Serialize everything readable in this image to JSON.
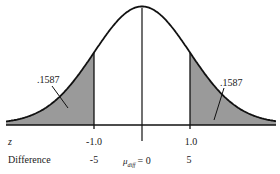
{
  "figure": {
    "colors": {
      "background": "#ffffff",
      "curve": "#111111",
      "shade": "#9a9a9a",
      "text": "#1a1a1a"
    },
    "left_tail": {
      "label": ".1587"
    },
    "right_tail": {
      "label": ".1587"
    },
    "axis": {
      "z_label": "z",
      "difference_label": "Difference",
      "z_ticks": [
        "-1.0",
        "1.0"
      ],
      "difference_ticks": [
        "-5",
        "5"
      ],
      "center_label_mu": "μ",
      "center_label_sub": "diff",
      "center_label_eq": "= 0"
    }
  },
  "chart_data": {
    "type": "area",
    "title": "",
    "xlabel": "z / Difference",
    "ylabel": "",
    "distribution": "normal",
    "mean": 0,
    "sd_difference": 5,
    "shaded_regions": [
      {
        "z_range": [
          "-inf",
          -1.0
        ],
        "difference_range": [
          "-inf",
          -5
        ],
        "area": 0.1587,
        "label": ".1587"
      },
      {
        "z_range": [
          1.0,
          "inf"
        ],
        "difference_range": [
          5,
          "inf"
        ],
        "area": 0.1587,
        "label": ".1587"
      }
    ],
    "x_axes": [
      {
        "name": "z",
        "ticks": [
          -1.0,
          1.0
        ]
      },
      {
        "name": "Difference",
        "ticks": [
          -5,
          0,
          5
        ],
        "center_label": "μ_diff = 0"
      }
    ],
    "grid": false
  }
}
